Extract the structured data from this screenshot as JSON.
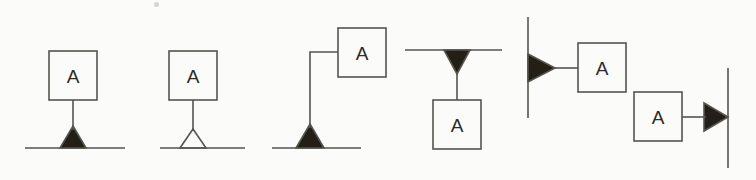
{
  "figure": {
    "background_color": "#fbfbf9",
    "stroke_color": "#55554e",
    "fill_color": "#241f16",
    "text_color": "#2b2b28",
    "stroke_width": 1.6,
    "canvas": {
      "width": 756,
      "height": 180
    }
  },
  "symbols": [
    {
      "id": "variant-1",
      "name": "filled-triangle-on-baseline-with-box-above",
      "label": "A",
      "box": {
        "x": 49,
        "y": 51,
        "width": 48,
        "height": 49
      },
      "stem": {
        "x1": 73,
        "y1": 100,
        "x2": 73,
        "y2": 130
      },
      "baseline": {
        "x1": 25,
        "y1": 148,
        "x2": 125,
        "y2": 148
      },
      "marker": {
        "kind": "triangle",
        "fill": "solid",
        "direction": "up",
        "points": "73,126 86,148 60,148"
      }
    },
    {
      "id": "variant-2",
      "name": "hollow-triangle-on-baseline-with-box-above",
      "label": "A",
      "box": {
        "x": 169,
        "y": 51,
        "width": 48,
        "height": 49
      },
      "stem": {
        "x1": 193,
        "y1": 100,
        "x2": 193,
        "y2": 131
      },
      "baseline": {
        "x1": 160,
        "y1": 148,
        "x2": 245,
        "y2": 148
      },
      "marker": {
        "kind": "triangle",
        "fill": "hollow",
        "direction": "up",
        "points": "193,129 206,148 180,148"
      }
    },
    {
      "id": "variant-3",
      "name": "filled-triangle-on-baseline-with-offset-box-elbow",
      "label": "A",
      "box": {
        "x": 338,
        "y": 28,
        "width": 48,
        "height": 49
      },
      "elbow": {
        "points": "338,52 310,52 310,128"
      },
      "baseline": {
        "x1": 272,
        "y1": 148,
        "x2": 361,
        "y2": 148
      },
      "marker": {
        "kind": "triangle",
        "fill": "solid",
        "direction": "up",
        "points": "310,124 324,148 296,148"
      }
    },
    {
      "id": "variant-4",
      "name": "inverted-filled-triangle-under-line-with-box-below",
      "label": "A",
      "box": {
        "x": 433,
        "y": 100,
        "width": 48,
        "height": 49
      },
      "stem": {
        "x1": 457,
        "y1": 72,
        "x2": 457,
        "y2": 100
      },
      "baseline": {
        "x1": 405,
        "y1": 50,
        "x2": 502,
        "y2": 50
      },
      "marker": {
        "kind": "triangle",
        "fill": "solid",
        "direction": "down",
        "points": "444,50 470,50 457,74"
      }
    },
    {
      "id": "variant-5a",
      "name": "right-pointing-filled-triangle-on-left-vertical-line",
      "label": "A",
      "box": {
        "x": 578,
        "y": 43,
        "width": 48,
        "height": 49
      },
      "stem": {
        "x1": 553,
        "y1": 68,
        "x2": 578,
        "y2": 68
      },
      "baseline": {
        "x1": 528,
        "y1": 17,
        "x2": 528,
        "y2": 118
      },
      "marker": {
        "kind": "triangle",
        "fill": "solid",
        "direction": "right",
        "points": "528,54 555,68 528,82"
      }
    },
    {
      "id": "variant-5b",
      "name": "right-pointing-filled-triangle-on-right-vertical-line",
      "label": "A",
      "box": {
        "x": 634,
        "y": 92,
        "width": 48,
        "height": 49
      },
      "stem": {
        "x1": 682,
        "y1": 117,
        "x2": 706,
        "y2": 117
      },
      "baseline": {
        "x1": 728,
        "y1": 68,
        "x2": 728,
        "y2": 168
      },
      "marker": {
        "kind": "triangle",
        "fill": "solid",
        "direction": "right",
        "points": "704,103 728,117 704,131"
      }
    }
  ],
  "artifacts": [
    {
      "name": "scan-speck",
      "x": 154,
      "y": 2
    }
  ]
}
